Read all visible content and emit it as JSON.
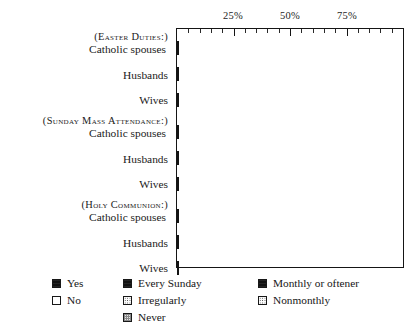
{
  "chart_data": {
    "type": "bar",
    "orientation": "horizontal",
    "stacked": true,
    "title": "",
    "xlabel": "",
    "ylabel": "",
    "xlim": [
      0,
      100
    ],
    "grid": false,
    "legend_position": "bottom",
    "axis": {
      "tick_labels": [
        "25%",
        "50%",
        "75%"
      ],
      "tick_values": [
        25,
        50,
        75
      ],
      "minor_tick_step": 5
    },
    "groups": [
      {
        "heading": "(Easter Duties:)",
        "legend_keys": [
          "Yes",
          "No"
        ],
        "rows": [
          {
            "label": "Catholic spouses",
            "values": [
              70,
              30
            ]
          },
          {
            "label": "Husbands",
            "values": [
              32,
              68
            ]
          },
          {
            "label": "Wives",
            "values": [
              82,
              18
            ]
          }
        ]
      },
      {
        "heading": "(Sunday Mass Attendance:)",
        "legend_keys": [
          "Every Sunday",
          "Irregularly",
          "Never"
        ],
        "rows": [
          {
            "label": "Catholic spouses",
            "values": [
              57,
              23,
              20
            ]
          },
          {
            "label": "Husbands",
            "values": [
              22,
              35,
              43
            ]
          },
          {
            "label": "Wives",
            "values": [
              78,
              12,
              10
            ]
          }
        ]
      },
      {
        "heading": "(Holy Communion:)",
        "legend_keys": [
          "Monthly or oftener",
          "Nonmonthly"
        ],
        "rows": [
          {
            "label": "Catholic spouses",
            "values": [
              22,
              78
            ]
          },
          {
            "label": "Husbands",
            "values": [
              10,
              90
            ]
          },
          {
            "label": "Wives",
            "values": [
              31,
              69
            ]
          }
        ]
      }
    ],
    "legend": [
      {
        "column": 1,
        "entries": [
          {
            "label": "Yes",
            "pattern": "solid-black"
          },
          {
            "label": "No",
            "pattern": "empty-white"
          }
        ]
      },
      {
        "column": 2,
        "entries": [
          {
            "label": "Every Sunday",
            "pattern": "solid-black"
          },
          {
            "label": "Irregularly",
            "pattern": "stipple"
          },
          {
            "label": "Never",
            "pattern": "checker-gray"
          }
        ]
      },
      {
        "column": 3,
        "entries": [
          {
            "label": "Monthly or oftener",
            "pattern": "solid-black"
          },
          {
            "label": "Nonmonthly",
            "pattern": "stipple"
          }
        ]
      }
    ],
    "colors": {
      "ink": "#141414",
      "paper": "#ffffff",
      "stipple": "#333333",
      "hatch": "#1b1b1b"
    }
  }
}
